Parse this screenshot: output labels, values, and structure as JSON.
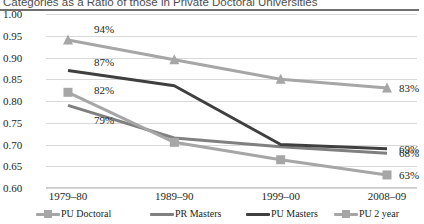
{
  "chart_data": {
    "type": "line",
    "title": "Categories as a Ratio of those in Private Doctoral Universities",
    "xlabel": "",
    "ylabel": "",
    "ylim": [
      0.6,
      1.0
    ],
    "ytick_step": 0.05,
    "grid": true,
    "legend_position": "bottom",
    "categories": [
      "1979–80",
      "1989–90",
      "1999–00",
      "2008–09"
    ],
    "yticks": [
      "1.00",
      "0.95",
      "0.90",
      "0.85",
      "0.80",
      "0.75",
      "0.70",
      "0.65",
      "0.60"
    ],
    "ytick_values": [
      1.0,
      0.95,
      0.9,
      0.85,
      0.8,
      0.75,
      0.7,
      0.65,
      0.6
    ],
    "series": [
      {
        "name": "PU Doctoral",
        "color": "#a6a6a6",
        "marker": "triangle",
        "values": [
          0.94,
          0.895,
          0.85,
          0.83
        ],
        "labels": [
          "94%",
          "",
          "",
          "83%"
        ]
      },
      {
        "name": "PR Masters",
        "color": "#808080",
        "marker": "none",
        "values": [
          0.79,
          0.715,
          0.695,
          0.68
        ],
        "labels": [
          "79%",
          "",
          "",
          "68%"
        ]
      },
      {
        "name": "PU Masters",
        "color": "#3f3f3f",
        "marker": "none",
        "values": [
          0.87,
          0.835,
          0.7,
          0.69
        ],
        "labels": [
          "87%",
          "",
          "",
          "69%"
        ]
      },
      {
        "name": "PU 2 year",
        "color": "#a6a6a6",
        "marker": "square",
        "values": [
          0.82,
          0.705,
          0.665,
          0.63
        ],
        "labels": [
          "82%",
          "",
          "",
          "63%"
        ]
      }
    ],
    "data_labels": {
      "left": [
        "94%",
        "87%",
        "82%",
        "79%"
      ],
      "right": [
        "83%",
        "69%",
        "68%",
        "63%"
      ]
    }
  },
  "legend": {
    "items": [
      {
        "label": "PU Doctoral",
        "color": "#a6a6a6",
        "marker": "square"
      },
      {
        "label": "PR Masters",
        "color": "#808080",
        "marker": "none"
      },
      {
        "label": "PU Masters",
        "color": "#3f3f3f",
        "marker": "none"
      },
      {
        "label": "PU 2 year",
        "color": "#a6a6a6",
        "marker": "square"
      }
    ]
  }
}
